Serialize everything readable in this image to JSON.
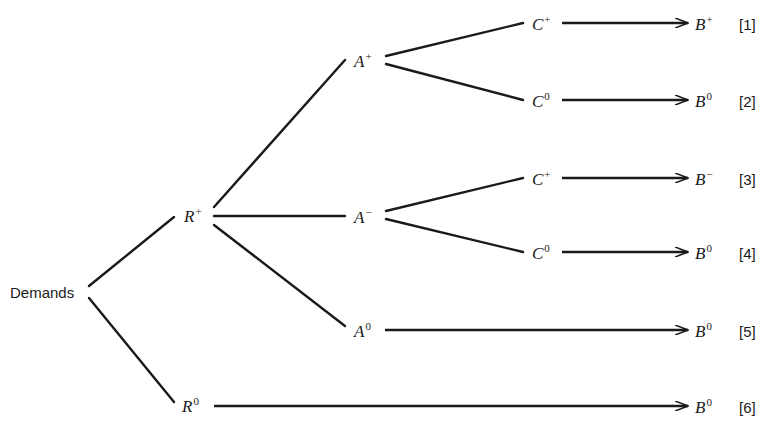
{
  "diagram": {
    "type": "tree",
    "root": {
      "label": "Demands"
    },
    "nodes": {
      "r_plus": {
        "base": "R",
        "sup": "+"
      },
      "r_zero": {
        "base": "R",
        "sup": "0"
      },
      "a_plus": {
        "base": "A",
        "sup": "+"
      },
      "a_minus": {
        "base": "A",
        "sup": "−"
      },
      "a_zero": {
        "base": "A",
        "sup": "0"
      },
      "c1": {
        "base": "C",
        "sup": "+"
      },
      "c2": {
        "base": "C",
        "sup": "0"
      },
      "c3": {
        "base": "C",
        "sup": "+"
      },
      "c4": {
        "base": "C",
        "sup": "0"
      }
    },
    "outcomes": [
      {
        "base": "B",
        "sup": "+",
        "index": "[1]"
      },
      {
        "base": "B",
        "sup": "0",
        "index": "[2]"
      },
      {
        "base": "B",
        "sup": "−",
        "index": "[3]"
      },
      {
        "base": "B",
        "sup": "0",
        "index": "[4]"
      },
      {
        "base": "B",
        "sup": "0",
        "index": "[5]"
      },
      {
        "base": "B",
        "sup": "0",
        "index": "[6]"
      }
    ],
    "edges": [
      [
        "Demands",
        "R+"
      ],
      [
        "Demands",
        "R0"
      ],
      [
        "R+",
        "A+"
      ],
      [
        "R+",
        "A-"
      ],
      [
        "R+",
        "A0"
      ],
      [
        "A+",
        "C+"
      ],
      [
        "A+",
        "C0"
      ],
      [
        "A-",
        "C+"
      ],
      [
        "A-",
        "C0"
      ],
      [
        "C+",
        "B+ [1]"
      ],
      [
        "C0",
        "B0 [2]"
      ],
      [
        "C+",
        "B- [3]"
      ],
      [
        "C0",
        "B0 [4]"
      ],
      [
        "A0",
        "B0 [5]"
      ],
      [
        "R0",
        "B0 [6]"
      ]
    ],
    "line_color": "#1a1a1a"
  }
}
